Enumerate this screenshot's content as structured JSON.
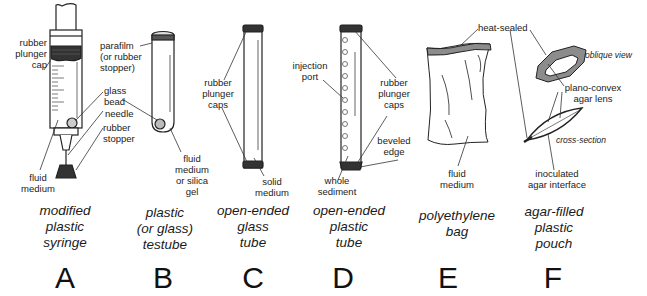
{
  "panels": [
    {
      "letter": "A",
      "caption": "modified\nplastic\nsyringe",
      "labels": {
        "rubber_plunger_cap": "rubber\nplunger\ncap",
        "glass_bead": "glass\nbead",
        "needle": "needle",
        "rubber_stopper": "rubber\nstopper",
        "fluid_medium": "fluid\nmedium"
      }
    },
    {
      "letter": "B",
      "caption": "plastic\n(or glass)\ntestube",
      "labels": {
        "parafilm": "parafilm\n(or rubber\nstopper)",
        "fluid_medium": "fluid\nmedium\nor silica\ngel"
      }
    },
    {
      "letter": "C",
      "caption": "open-ended\nglass\ntube",
      "labels": {
        "rubber_plunger_caps": "rubber\nplunger\ncaps",
        "solid_medium": "solid\nmedium"
      }
    },
    {
      "letter": "D",
      "caption": "open-ended\nplastic\ntube",
      "labels": {
        "injection_port": "injection\nport",
        "rubber_plunger_caps": "rubber\nplunger\ncaps",
        "beveled_edge": "beveled\nedge",
        "whole_sediment": "whole\nsediment"
      }
    },
    {
      "letter": "E",
      "caption": "polyethylene\nbag",
      "labels": {
        "fluid_medium": "fluid\nmedium"
      }
    },
    {
      "letter": "F",
      "caption": "agar-filled\nplastic\npouch",
      "labels": {
        "heat_sealed": "heat-sealed",
        "oblique_view": "oblique view",
        "plano_convex": "plano-convex\nagar lens",
        "cross_section": "cross-section",
        "inoculated": "inoculated\nagar interface"
      }
    }
  ],
  "colors": {
    "line": "#222222",
    "cap_fill": "#333333",
    "seal_fill": "#8c8c8c",
    "glass_highlight": "#999999"
  }
}
